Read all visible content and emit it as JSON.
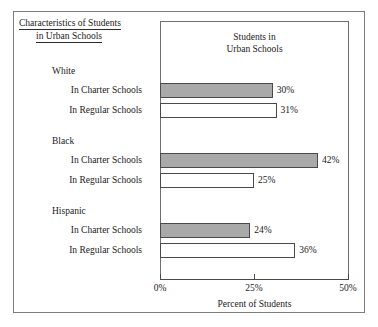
{
  "figure": {
    "title_line1": "Characteristics of Students",
    "title_line2": "in Urban Schools",
    "plot_heading_line1": "Students in",
    "plot_heading_line2": "Urban Schools"
  },
  "chart_data": {
    "type": "bar",
    "orientation": "horizontal",
    "title": "Students in Urban Schools",
    "xlabel": "Percent of Students",
    "ylabel": "",
    "xlim": [
      0,
      50
    ],
    "xticks": [
      0,
      25,
      50
    ],
    "xtick_labels": [
      "0%",
      "25%",
      "50%"
    ],
    "grid": false,
    "legend": "none",
    "value_suffix": "%",
    "groups": [
      {
        "name": "White",
        "bars": [
          {
            "label": "In Charter Schools",
            "value": 30,
            "value_label": "30%",
            "style": "charter"
          },
          {
            "label": "In Regular Schools",
            "value": 31,
            "value_label": "31%",
            "style": "regular"
          }
        ]
      },
      {
        "name": "Black",
        "bars": [
          {
            "label": "In Charter Schools",
            "value": 42,
            "value_label": "42%",
            "style": "charter"
          },
          {
            "label": "In Regular Schools",
            "value": 25,
            "value_label": "25%",
            "style": "regular"
          }
        ]
      },
      {
        "name": "Hispanic",
        "bars": [
          {
            "label": "In Charter Schools",
            "value": 24,
            "value_label": "24%",
            "style": "charter"
          },
          {
            "label": "In Regular Schools",
            "value": 36,
            "value_label": "36%",
            "style": "regular"
          }
        ]
      }
    ],
    "series": [
      {
        "name": "In Charter Schools",
        "categories": [
          "White",
          "Black",
          "Hispanic"
        ],
        "values": [
          30,
          42,
          24
        ]
      },
      {
        "name": "In Regular Schools",
        "categories": [
          "White",
          "Black",
          "Hispanic"
        ],
        "values": [
          31,
          25,
          36
        ]
      }
    ],
    "colors": {
      "charter_fill": "#a9a9a9",
      "regular_fill": "#ffffff",
      "bar_border": "#4a4a4a",
      "axis": "#4a4a4a",
      "text": "#1a1a1a"
    }
  }
}
